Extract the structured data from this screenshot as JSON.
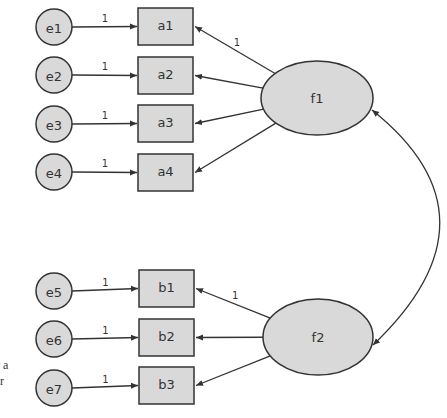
{
  "colors": {
    "fill": "#d9d9d9",
    "stroke": "#333333",
    "background": "#ffffff"
  },
  "errors": [
    {
      "id": "e1",
      "label": "e1",
      "cx": 54,
      "cy": 27,
      "coef": "1"
    },
    {
      "id": "e2",
      "label": "e2",
      "cx": 54,
      "cy": 75,
      "coef": "1"
    },
    {
      "id": "e3",
      "label": "e3",
      "cx": 54,
      "cy": 124,
      "coef": "1"
    },
    {
      "id": "e4",
      "label": "e4",
      "cx": 54,
      "cy": 172,
      "coef": "1"
    },
    {
      "id": "e5",
      "label": "e5",
      "cx": 54,
      "cy": 291,
      "coef": "1"
    },
    {
      "id": "e6",
      "label": "e6",
      "cx": 54,
      "cy": 339,
      "coef": "1"
    },
    {
      "id": "e7",
      "label": "e7",
      "cx": 54,
      "cy": 388,
      "coef": "1"
    }
  ],
  "indicators": [
    {
      "id": "a1",
      "label": "a1",
      "x": 138,
      "y": 8
    },
    {
      "id": "a2",
      "label": "a2",
      "x": 138,
      "y": 57
    },
    {
      "id": "a3",
      "label": "a3",
      "x": 138,
      "y": 105
    },
    {
      "id": "a4",
      "label": "a4",
      "x": 138,
      "y": 154
    },
    {
      "id": "b1",
      "label": "b1",
      "x": 139,
      "y": 270
    },
    {
      "id": "b2",
      "label": "b2",
      "x": 139,
      "y": 319
    },
    {
      "id": "b3",
      "label": "b3",
      "x": 139,
      "y": 367
    }
  ],
  "factors": [
    {
      "id": "f1",
      "label": "f1",
      "cx": 317,
      "cy": 98,
      "rx": 56,
      "ry": 37,
      "loading_label": "1"
    },
    {
      "id": "f2",
      "label": "f2",
      "cx": 318,
      "cy": 337,
      "rx": 55,
      "ry": 38,
      "loading_label": "1"
    }
  ],
  "side_text": [
    "r a",
    "or"
  ]
}
